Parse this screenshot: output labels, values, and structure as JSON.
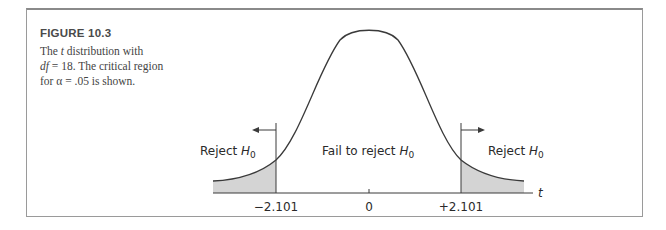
{
  "figure": {
    "title": "FIGURE 10.3",
    "caption_line1_pre": "The ",
    "caption_line1_var": "t",
    "caption_line1_post": " distribution with",
    "caption_line2_var": "df",
    "caption_line2_post": " = 18. The critical region",
    "caption_line3": "for α = .05 is shown."
  },
  "chart_data": {
    "type": "area",
    "title": "The t distribution with df = 18. The critical region for α = .05 is shown.",
    "distribution": "t",
    "df": 18,
    "alpha": 0.05,
    "xlabel": "t",
    "tick_labels": [
      "-2.101",
      "0",
      "+2.101"
    ],
    "tick_values": [
      -2.101,
      0,
      2.101
    ],
    "critical_values": [
      -2.101,
      2.101
    ],
    "regions": [
      {
        "name": "Reject H0",
        "range": [
          "-inf",
          -2.101
        ],
        "shaded": true
      },
      {
        "name": "Fail to reject H0",
        "range": [
          -2.101,
          2.101
        ],
        "shaded": false
      },
      {
        "name": "Reject H0",
        "range": [
          2.101,
          "inf"
        ],
        "shaded": true
      }
    ],
    "grid": false
  },
  "labels": {
    "reject_left": "Reject H",
    "fail": "Fail to reject H",
    "reject_right": "Reject H",
    "subscript": "0",
    "tick_left": "−2.101",
    "tick_center": "0",
    "tick_right": "+2.101",
    "axis_var": "t"
  },
  "colors": {
    "shade": "#d4d4d4",
    "line": "#3a3a3a"
  }
}
